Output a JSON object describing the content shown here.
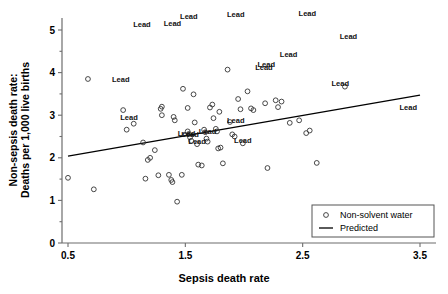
{
  "chart_data": {
    "type": "scatter",
    "title": "",
    "xlabel": "Sepsis death rate",
    "ylabel": "Non-sepsis death rate:\nDeaths per 1,000 live births",
    "ylabel_line1": "Non-sepsis death rate:",
    "ylabel_line2": "Deaths per 1,000 live births",
    "xlim": [
      0.5,
      3.5
    ],
    "ylim": [
      0,
      5.4
    ],
    "xticks": [
      0.5,
      1.5,
      2.5,
      3.5
    ],
    "xtick_labels": [
      "0.5",
      "1.5",
      "2.5",
      "3.5"
    ],
    "yticks": [
      0,
      1,
      2,
      3,
      4,
      5
    ],
    "ytick_labels": [
      "0",
      "1",
      "2",
      "3",
      "4",
      "5"
    ],
    "grid": false,
    "legend_position": "lower-right",
    "legend": [
      {
        "label": "Non-solvent water",
        "marker": "circle-open"
      },
      {
        "label": "Predicted",
        "marker": "line"
      }
    ],
    "series": [
      {
        "name": "Non-solvent water",
        "marker": "circle-open",
        "points": [
          [
            0.5,
            1.53
          ],
          [
            0.67,
            3.85
          ],
          [
            0.72,
            1.26
          ],
          [
            0.97,
            3.12
          ],
          [
            1.0,
            2.66
          ],
          [
            1.06,
            2.8
          ],
          [
            1.14,
            2.36
          ],
          [
            1.16,
            1.51
          ],
          [
            1.18,
            1.95
          ],
          [
            1.2,
            2.0
          ],
          [
            1.24,
            2.18
          ],
          [
            1.27,
            1.59
          ],
          [
            1.29,
            3.15
          ],
          [
            1.3,
            3.2
          ],
          [
            1.3,
            3.0
          ],
          [
            1.36,
            1.6
          ],
          [
            1.38,
            1.48
          ],
          [
            1.39,
            1.43
          ],
          [
            1.4,
            2.96
          ],
          [
            1.41,
            2.88
          ],
          [
            1.43,
            0.97
          ],
          [
            1.47,
            1.6
          ],
          [
            1.48,
            3.62
          ],
          [
            1.52,
            3.17
          ],
          [
            1.52,
            2.62
          ],
          [
            1.53,
            2.56
          ],
          [
            1.54,
            2.48
          ],
          [
            1.55,
            2.4
          ],
          [
            1.57,
            3.49
          ],
          [
            1.58,
            2.83
          ],
          [
            1.6,
            2.32
          ],
          [
            1.61,
            1.84
          ],
          [
            1.64,
            1.82
          ],
          [
            1.66,
            2.66
          ],
          [
            1.67,
            2.6
          ],
          [
            1.68,
            2.45
          ],
          [
            1.69,
            2.38
          ],
          [
            1.71,
            3.18
          ],
          [
            1.73,
            3.25
          ],
          [
            1.74,
            2.93
          ],
          [
            1.76,
            2.68
          ],
          [
            1.77,
            2.62
          ],
          [
            1.78,
            2.22
          ],
          [
            1.79,
            3.08
          ],
          [
            1.8,
            2.24
          ],
          [
            1.82,
            1.87
          ],
          [
            1.86,
            4.07
          ],
          [
            1.88,
            2.84
          ],
          [
            1.9,
            2.55
          ],
          [
            1.92,
            2.5
          ],
          [
            1.95,
            3.38
          ],
          [
            1.97,
            3.14
          ],
          [
            1.99,
            2.34
          ],
          [
            2.03,
            3.56
          ],
          [
            2.06,
            3.16
          ],
          [
            2.08,
            3.12
          ],
          [
            2.18,
            3.28
          ],
          [
            2.2,
            1.76
          ],
          [
            2.27,
            3.35
          ],
          [
            2.29,
            3.19
          ],
          [
            2.32,
            3.32
          ],
          [
            2.39,
            2.82
          ],
          [
            2.47,
            2.88
          ],
          [
            2.53,
            2.58
          ],
          [
            2.56,
            2.64
          ],
          [
            2.62,
            1.88
          ],
          [
            2.86,
            3.67
          ]
        ]
      }
    ],
    "fit_line": {
      "name": "Predicted",
      "x0": 0.5,
      "y0": 2.04,
      "x1": 3.5,
      "y1": 3.47
    },
    "annotations": [
      {
        "text": "Lead",
        "x": 1.13,
        "y": 5.06
      },
      {
        "text": "Lead",
        "x": 1.39,
        "y": 5.1
      },
      {
        "text": "Lead",
        "x": 1.53,
        "y": 5.26
      },
      {
        "text": "Lead",
        "x": 1.93,
        "y": 5.3
      },
      {
        "text": "Lead",
        "x": 2.54,
        "y": 5.33
      },
      {
        "text": "Lead",
        "x": 2.89,
        "y": 4.78
      },
      {
        "text": "Lead",
        "x": 2.38,
        "y": 4.36
      },
      {
        "text": "Lead",
        "x": 2.19,
        "y": 4.12
      },
      {
        "text": "Lead",
        "x": 2.17,
        "y": 4.06
      },
      {
        "text": "Lead",
        "x": 0.95,
        "y": 3.78
      },
      {
        "text": "Lead",
        "x": 2.82,
        "y": 3.69
      },
      {
        "text": "Lead",
        "x": 3.4,
        "y": 3.12
      },
      {
        "text": "Lead",
        "x": 1.02,
        "y": 2.88
      },
      {
        "text": "Lead",
        "x": 1.93,
        "y": 2.82
      },
      {
        "text": "Lead",
        "x": 1.69,
        "y": 2.57
      },
      {
        "text": "Lead",
        "x": 1.51,
        "y": 2.52
      },
      {
        "text": "Lead",
        "x": 1.54,
        "y": 2.5
      },
      {
        "text": "Lead",
        "x": 1.6,
        "y": 2.33
      },
      {
        "text": "Lead",
        "x": 1.99,
        "y": 2.35
      }
    ]
  }
}
